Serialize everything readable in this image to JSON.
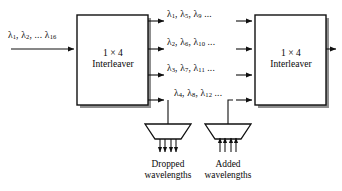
{
  "figure": {
    "type": "optical-interleaver-add-drop-diagram",
    "stroke_color": "#101010",
    "shadow_color": "#8a8a8a",
    "background": "#ffffff"
  },
  "input": {
    "label_plain": "λ1, λ2, ... λ16",
    "lambdas": [
      {
        "sub": "1",
        "sep": ", "
      },
      {
        "sub": "2",
        "sep": ", ... "
      },
      {
        "sub": "16",
        "sep": ""
      }
    ]
  },
  "blocks": [
    {
      "name": "left-interleaver",
      "line1": "1 × 4",
      "line2": "Interleaver"
    },
    {
      "name": "right-interleaver",
      "line1": "1 × 4",
      "line2": "Interleaver"
    }
  ],
  "channels": [
    {
      "index": 1,
      "label_plain": "λ1, λ5, λ9 ...",
      "subs": [
        "1",
        "5",
        "9"
      ],
      "tail": "..."
    },
    {
      "index": 2,
      "label_plain": "λ2, λ6, λ10 ...",
      "subs": [
        "2",
        "6",
        "10"
      ],
      "tail": "..."
    },
    {
      "index": 3,
      "label_plain": "λ3, λ7, λ11 ...",
      "subs": [
        "3",
        "7",
        "11"
      ],
      "tail": "..."
    },
    {
      "index": 4,
      "label_plain": "λ4, λ8, λ12 ...",
      "subs": [
        "4",
        "8",
        "12"
      ],
      "tail": "..."
    }
  ],
  "ports": [
    {
      "name": "dropped",
      "line1": "Dropped",
      "line2": "wavelengths",
      "direction": "down",
      "fiber_count": 4
    },
    {
      "name": "added",
      "line1": "Added",
      "line2": "wavelengths",
      "direction": "up",
      "fiber_count": 4
    }
  ]
}
